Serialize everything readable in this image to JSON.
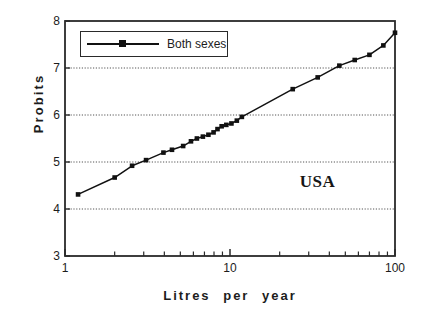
{
  "chart_data": {
    "type": "line",
    "title": "",
    "subtitle": "",
    "xlabel": "Litres  per  year",
    "ylabel": "Probits",
    "xscale": "log",
    "yscale": "linear",
    "xlim": [
      1,
      100
    ],
    "ylim": [
      3,
      8
    ],
    "xticks": [
      1,
      10,
      100
    ],
    "xtick_labels": [
      "1",
      "10",
      "100"
    ],
    "yticks": [
      3,
      4,
      5,
      6,
      7,
      8
    ],
    "ytick_labels": [
      "3",
      "4",
      "5",
      "6",
      "7",
      "8"
    ],
    "grid": "horizontal-dotted",
    "gridlines_y": [
      4,
      5,
      6,
      7
    ],
    "legend_position": "top-left-inside",
    "legend": [
      "Both sexes"
    ],
    "annotations": [
      {
        "text": "USA",
        "x": 35,
        "y": 4.55
      }
    ],
    "series": [
      {
        "name": "Both sexes",
        "marker": "square",
        "color": "#111111",
        "points": [
          [
            1.2,
            4.31
          ],
          [
            2.0,
            4.67
          ],
          [
            2.55,
            4.92
          ],
          [
            3.1,
            5.04
          ],
          [
            3.95,
            5.2
          ],
          [
            4.45,
            5.26
          ],
          [
            5.2,
            5.34
          ],
          [
            5.8,
            5.44
          ],
          [
            6.3,
            5.5
          ],
          [
            6.85,
            5.54
          ],
          [
            7.4,
            5.58
          ],
          [
            7.95,
            5.63
          ],
          [
            8.4,
            5.7
          ],
          [
            8.9,
            5.76
          ],
          [
            9.5,
            5.79
          ],
          [
            10.2,
            5.82
          ],
          [
            11.0,
            5.88
          ],
          [
            11.8,
            5.96
          ],
          [
            24.0,
            6.55
          ],
          [
            34.0,
            6.8
          ],
          [
            46.0,
            7.05
          ],
          [
            57.0,
            7.17
          ],
          [
            70.0,
            7.28
          ],
          [
            85.0,
            7.48
          ],
          [
            100.0,
            7.75
          ]
        ]
      }
    ]
  },
  "axes": {
    "ylabel_text": "Probits",
    "xlabel_text": "Litres  per  year"
  },
  "legend": {
    "label": "Both sexes"
  },
  "annotation": {
    "usa": "USA"
  }
}
